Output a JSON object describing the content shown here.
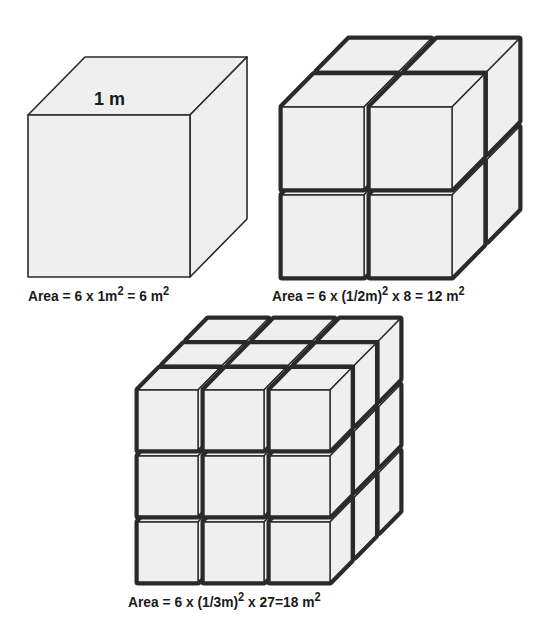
{
  "figure": {
    "colors": {
      "face": "#efefef",
      "edge": "#2a2a2a",
      "gap": "#6e6e6e",
      "background": "#ffffff"
    },
    "panels": [
      {
        "id": "cube-1",
        "divisions": 1,
        "edge_label": "1 m",
        "caption": {
          "prefix": "Area = 6 x 1m",
          "sup1": "2",
          "mid": " = 6 m",
          "sup2": "2",
          "tail": ""
        }
      },
      {
        "id": "cube-2",
        "divisions": 2,
        "caption": {
          "prefix": "Area = 6 x (1/2m)",
          "sup1": "2",
          "mid": " x 8 = 12 m",
          "sup2": "2",
          "tail": ""
        }
      },
      {
        "id": "cube-3",
        "divisions": 3,
        "caption": {
          "prefix": "Area = 6 x (1/3m)",
          "sup1": "2",
          "mid": " x 27=18 m",
          "sup2": "2",
          "tail": ""
        }
      }
    ]
  }
}
